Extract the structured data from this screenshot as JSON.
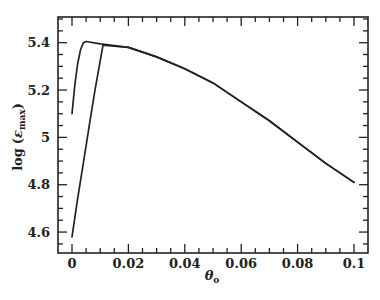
{
  "chart_data": {
    "type": "line",
    "title": "",
    "xlabel": "θ_o",
    "ylabel": "log (ε_max)",
    "xlim": [
      -0.005,
      0.105
    ],
    "ylim": [
      4.5,
      5.5
    ],
    "grid": false,
    "legend": null,
    "x_ticks": [
      0,
      0.02,
      0.04,
      0.06,
      0.08,
      0.1
    ],
    "x_tick_labels": [
      "0",
      "0.02",
      "0.04",
      "0.06",
      "0.08",
      "0.1"
    ],
    "x_minor_step": 0.005,
    "y_ticks": [
      4.6,
      4.8,
      5.0,
      5.2,
      5.4
    ],
    "y_tick_labels": [
      "4.6",
      "4.8",
      "5",
      "5.2",
      "5.4"
    ],
    "y_minor_step": 0.05,
    "series": [
      {
        "name": "curve-upper-start",
        "x": [
          0.0,
          0.001,
          0.002,
          0.003,
          0.004,
          0.005,
          0.01,
          0.02,
          0.03,
          0.04,
          0.05,
          0.06,
          0.07,
          0.08,
          0.09,
          0.1
        ],
        "y": [
          5.1,
          5.22,
          5.31,
          5.37,
          5.4,
          5.405,
          5.395,
          5.38,
          5.34,
          5.29,
          5.23,
          5.15,
          5.07,
          4.98,
          4.89,
          4.81
        ]
      },
      {
        "name": "curve-lower-start",
        "x": [
          0.0,
          0.002,
          0.004,
          0.006,
          0.008,
          0.011,
          0.02,
          0.03,
          0.04,
          0.05,
          0.06,
          0.07,
          0.08,
          0.09,
          0.1
        ],
        "y": [
          4.58,
          4.74,
          4.89,
          5.04,
          5.19,
          5.39,
          5.38,
          5.34,
          5.29,
          5.23,
          5.15,
          5.07,
          4.98,
          4.89,
          4.81
        ]
      }
    ]
  },
  "labels": {
    "ylabel_main": "log",
    "ylabel_symbol": "ε",
    "ylabel_sub": "max",
    "xlabel_symbol": "θ",
    "xlabel_sub": "o"
  }
}
